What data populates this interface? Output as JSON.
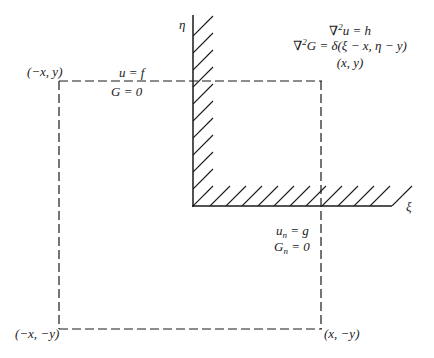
{
  "diagram": {
    "type": "quarter-plane Green's function image construction",
    "axes": {
      "vertical_label": "η",
      "horizontal_label": "ξ",
      "boundaries": [
        "η-axis (hatched wall)",
        "ξ-axis (hatched wall)"
      ]
    },
    "equations": {
      "line1": "∇²u = h",
      "line2": "∇²G = δ(ξ − x, η − y)",
      "line3": "(x, y)"
    },
    "boundary_conditions": {
      "top_upper": "u = f",
      "top_lower": "G = 0",
      "right_upper": "uₙ = g",
      "right_lower": "Gₙ = 0"
    },
    "corner_labels": {
      "top_left": "(−x, y)",
      "bottom_left": "(−x, −y)",
      "bottom_right": "(x, −y)",
      "top_right": "(x, y)"
    },
    "colors": {
      "ink": "#1a1a1a",
      "background": "#ffffff"
    }
  }
}
